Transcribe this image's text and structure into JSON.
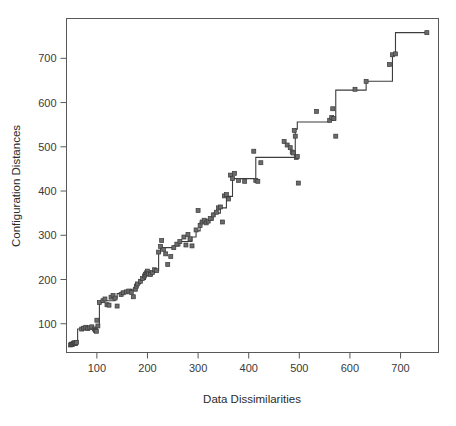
{
  "chart_data": {
    "type": "scatter",
    "title": "",
    "subtitle": "",
    "xlabel": "Data Dissimilarities",
    "ylabel": "Configuration Distances",
    "xlim": [
      40,
      775
    ],
    "ylim": [
      35,
      790
    ],
    "xticks": [
      100,
      200,
      300,
      400,
      500,
      600,
      700
    ],
    "yticks": [
      100,
      200,
      300,
      400,
      500,
      600,
      700
    ],
    "xtick_labels": [
      "100",
      "200",
      "300",
      "400",
      "500",
      "600",
      "700"
    ],
    "ytick_labels": [
      "100",
      "200",
      "300",
      "400",
      "500",
      "600",
      "700"
    ],
    "grid": false,
    "legend": null,
    "legend_position": "none",
    "point_style": {
      "marker": "square",
      "size": 4,
      "fill_color": "#6b6b6b",
      "edge_color": "#3a3a3a"
    },
    "line_style": {
      "name": "isotonic-step-fit",
      "drawstyle": "steps-post",
      "color": "#3d3d3d",
      "width": 1.1
    },
    "series": [
      {
        "name": "Observed points",
        "type": "scatter",
        "x": [
          48,
          50,
          52,
          54,
          56,
          58,
          60,
          70,
          74,
          78,
          82,
          86,
          90,
          95,
          97,
          99,
          100,
          102,
          105,
          112,
          116,
          120,
          124,
          128,
          132,
          136,
          140,
          148,
          152,
          158,
          163,
          168,
          172,
          176,
          178,
          180,
          186,
          190,
          194,
          196,
          198,
          200,
          202,
          206,
          210,
          214,
          218,
          222,
          226,
          228,
          232,
          236,
          240,
          246,
          252,
          258,
          264,
          272,
          276,
          280,
          284,
          288,
          296,
          300,
          304,
          308,
          312,
          316,
          320,
          324,
          330,
          336,
          340,
          344,
          348,
          352,
          356,
          360,
          364,
          368,
          372,
          380,
          392,
          410,
          414,
          418,
          424,
          470,
          476,
          482,
          486,
          488,
          490,
          492,
          494,
          496,
          498,
          534,
          560,
          564,
          566,
          568,
          572,
          610,
          632,
          678,
          684,
          690,
          752
        ],
        "y": [
          52,
          54,
          53,
          56,
          57,
          55,
          58,
          88,
          90,
          92,
          89,
          91,
          93,
          88,
          85,
          83,
          108,
          95,
          148,
          152,
          156,
          143,
          142,
          160,
          164,
          158,
          140,
          166,
          170,
          172,
          174,
          171,
          161,
          178,
          185,
          190,
          196,
          202,
          208,
          212,
          215,
          219,
          213,
          211,
          216,
          222,
          220,
          262,
          275,
          288,
          268,
          258,
          234,
          252,
          272,
          280,
          286,
          296,
          278,
          302,
          292,
          276,
          312,
          356,
          322,
          330,
          334,
          328,
          332,
          338,
          346,
          352,
          362,
          364,
          330,
          389,
          392,
          382,
          436,
          428,
          440,
          424,
          422,
          490,
          424,
          422,
          464,
          512,
          504,
          498,
          488,
          486,
          537,
          524,
          476,
          478,
          418,
          580,
          560,
          566,
          586,
          564,
          524,
          630,
          648,
          686,
          708,
          710,
          758
        ]
      },
      {
        "name": "Monotone step fit",
        "type": "line",
        "x": [
          48,
          60,
          62,
          70,
          97,
          99,
          100,
          105,
          112,
          136,
          140,
          148,
          163,
          168,
          176,
          186,
          196,
          206,
          214,
          222,
          226,
          236,
          252,
          264,
          276,
          288,
          296,
          304,
          312,
          320,
          330,
          344,
          352,
          356,
          364,
          368,
          392,
          410,
          414,
          424,
          470,
          490,
          492,
          496,
          534,
          560,
          566,
          572,
          610,
          632,
          678,
          684,
          690,
          752
        ],
        "y": [
          52,
          58,
          88,
          92,
          92,
          92,
          95,
          148,
          152,
          158,
          168,
          172,
          172,
          178,
          190,
          200,
          212,
          216,
          220,
          260,
          272,
          272,
          276,
          286,
          286,
          296,
          310,
          330,
          334,
          334,
          350,
          362,
          362,
          388,
          388,
          428,
          428,
          428,
          476,
          476,
          476,
          476,
          540,
          556,
          556,
          560,
          560,
          628,
          628,
          648,
          648,
          708,
          758,
          758
        ]
      }
    ]
  },
  "axes": {
    "x_axis_title": "Data Dissimilarities",
    "y_axis_title": "Configuration Distances"
  },
  "colors": {
    "frame": "#595959",
    "point_fill": "#6b6b6b",
    "point_edge": "#3a3a3a",
    "line": "#3d3d3d",
    "text": "#2b2b2b",
    "background": "#ffffff"
  }
}
